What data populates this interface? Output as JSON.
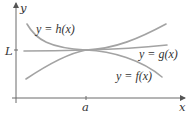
{
  "figure": {
    "axis_labels": {
      "x": "x",
      "y": "y"
    },
    "y_tick_label": "L",
    "x_tick_label": "a",
    "curve_labels": {
      "h": "y = h(x)",
      "g": "y = g(x)",
      "f": "y = f(x)"
    },
    "colors": {
      "axis": "#6b6b6b",
      "curve": "#a3a3a3",
      "text": "#333333"
    }
  }
}
